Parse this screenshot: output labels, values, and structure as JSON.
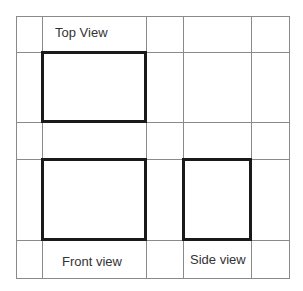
{
  "diagram": {
    "labels": {
      "top_view": "Top View",
      "front_view": "Front view",
      "side_view": "Side view"
    },
    "grid": {
      "vertical_lines_x": [
        16,
        42,
        146,
        183,
        251,
        289
      ],
      "horizontal_lines_y": [
        16,
        52,
        122,
        159,
        240,
        278
      ],
      "line_color": "#8a8a8a"
    },
    "views": [
      {
        "name": "Top View",
        "rect": {
          "x": 41,
          "y": 51,
          "w": 106,
          "h": 72
        }
      },
      {
        "name": "Front view",
        "rect": {
          "x": 41,
          "y": 158,
          "w": 106,
          "h": 83
        }
      },
      {
        "name": "Side view",
        "rect": {
          "x": 182,
          "y": 158,
          "w": 70,
          "h": 83
        }
      }
    ],
    "box_color": "#1a1a1a"
  }
}
